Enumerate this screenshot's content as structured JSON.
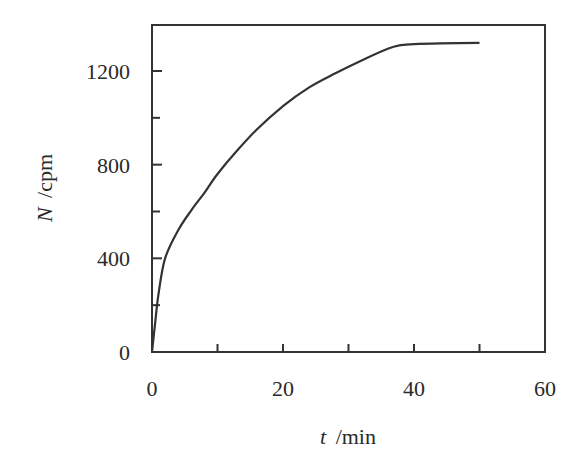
{
  "chart_data": {
    "type": "line",
    "title": "",
    "xlabel": "t /min",
    "xlabel_var": "t",
    "xlabel_unit": "/min",
    "ylabel": "N /cpm",
    "ylabel_var": "N",
    "ylabel_unit": "/cpm",
    "xlim": [
      0,
      60
    ],
    "ylim": [
      0,
      1380
    ],
    "x_ticks": [
      0,
      20,
      40,
      60
    ],
    "x_minor_ticks": [
      10,
      30,
      50
    ],
    "y_ticks": [
      0,
      400,
      800,
      1200
    ],
    "y_minor_ticks": [
      200,
      600,
      1000
    ],
    "grid": false,
    "legend": null,
    "series": [
      {
        "name": "N",
        "color": "#333333",
        "x": [
          0,
          0.5,
          1,
          2,
          4,
          6,
          8,
          10,
          13,
          16,
          20,
          24,
          28,
          32,
          36,
          38,
          40,
          44,
          50
        ],
        "y": [
          0,
          130,
          250,
          400,
          520,
          605,
          680,
          760,
          860,
          950,
          1050,
          1130,
          1190,
          1245,
          1295,
          1310,
          1315,
          1318,
          1320
        ]
      }
    ]
  }
}
